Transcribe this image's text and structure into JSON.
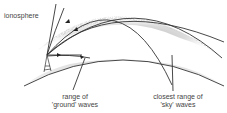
{
  "diagram": {
    "labels": {
      "ionosphere": "ionosphere",
      "ground_range_line1": "range of",
      "ground_range_line2": "'ground' waves",
      "sky_range_line1": "closest range of",
      "sky_range_line2": "'sky' waves"
    },
    "colors": {
      "lines": "#333333",
      "earth_fill": "#e6e6e6",
      "ionosphere_shade": "#9a9a9a",
      "text": "#444444"
    }
  }
}
